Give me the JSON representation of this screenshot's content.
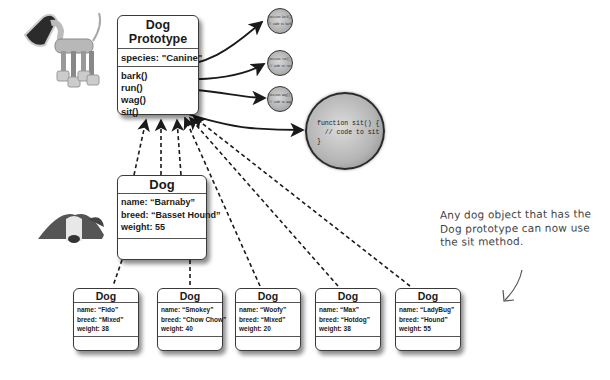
{
  "prototype": {
    "title": "Dog Prototype",
    "properties": [
      "species: \"Canine\""
    ],
    "methods": [
      "bark()",
      "run()",
      "wag()",
      "sit()"
    ]
  },
  "method_bodies": {
    "small": [
      {
        "line1": "function bark() {",
        "line2": "// code to bark",
        "line3": "}"
      },
      {
        "line1": "function run() {",
        "line2": "// code to run",
        "line3": "}"
      },
      {
        "line1": "function wag() {",
        "line2": "// code to wag",
        "line3": "}"
      }
    ],
    "sit": {
      "code": "function sit() {\n  // code to sit\n}"
    }
  },
  "barnaby": {
    "title": "Dog",
    "properties": [
      "name: “Barnaby”",
      "breed: “Basset Hound”",
      "weight: 55"
    ]
  },
  "dogs": [
    {
      "title": "Dog",
      "name": "name: “Fido”",
      "breed": "breed: “Mixed”",
      "weight": "weight: 38"
    },
    {
      "title": "Dog",
      "name": "name: “Smokey”",
      "breed": "breed: “Chow Chow”",
      "weight": "weight: 40"
    },
    {
      "title": "Dog",
      "name": "name: “Woofy”",
      "breed": "breed: “Mixed”",
      "weight": "weight: 20"
    },
    {
      "title": "Dog",
      "name": "name: “Max”",
      "breed": "breed: “Hotdog”",
      "weight": "weight: 38"
    },
    {
      "title": "Dog",
      "name": "name: “LadyBug”",
      "breed": "breed: “Hound”",
      "weight": "weight: 55"
    }
  ],
  "annotation": {
    "text": "Any dog object that has the Dog prototype can now use the sit method."
  },
  "images": {
    "robot_dog": "robot-dog-illustration",
    "basset_hound": "basset-hound-photo"
  }
}
